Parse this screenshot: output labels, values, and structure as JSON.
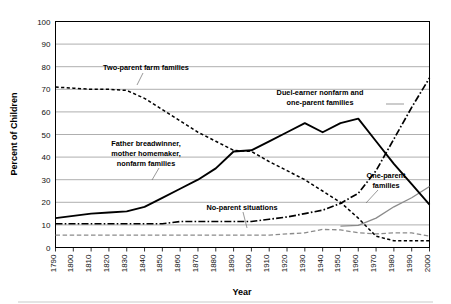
{
  "chart_data": {
    "type": "line",
    "title": "",
    "xlabel": "Year",
    "ylabel": "Percent of Children",
    "xlim": [
      1790,
      2000
    ],
    "ylim": [
      0,
      100
    ],
    "grid": true,
    "legend": "annotations-on-plot",
    "x": [
      1790,
      1800,
      1810,
      1820,
      1830,
      1840,
      1850,
      1860,
      1870,
      1880,
      1890,
      1900,
      1910,
      1920,
      1930,
      1940,
      1950,
      1960,
      1970,
      1980,
      1990,
      2000
    ],
    "y_ticks": [
      0,
      10,
      20,
      30,
      40,
      50,
      60,
      70,
      80,
      90,
      100
    ],
    "x_tick_labels": [
      "1790",
      "1800",
      "1810",
      "1820",
      "1830",
      "1840",
      "1850",
      "1860",
      "1870",
      "1880",
      "1890",
      "1900",
      "1910",
      "1920",
      "1930",
      "1940",
      "1950",
      "1960",
      "1970",
      "1980",
      "1990",
      "2000"
    ],
    "series": [
      {
        "name": "Two-parent farm families",
        "style": "dashed-black",
        "x": [
          1790,
          1800,
          1810,
          1820,
          1830,
          1840,
          1850,
          1860,
          1870,
          1880,
          1890,
          1900,
          1910,
          1920,
          1930,
          1940,
          1950,
          1960,
          1970,
          1980,
          1990,
          2000
        ],
        "values": [
          71,
          70.5,
          70,
          70,
          69.5,
          66,
          61,
          56,
          51,
          47,
          43,
          42.5,
          38,
          34,
          30,
          25,
          20,
          13,
          5,
          3,
          3,
          3
        ]
      },
      {
        "name": "Father breadwinner, mother homemaker, nonfarm families",
        "style": "solid-black",
        "x": [
          1790,
          1800,
          1810,
          1820,
          1830,
          1840,
          1850,
          1860,
          1870,
          1880,
          1890,
          1900,
          1910,
          1920,
          1930,
          1940,
          1950,
          1960,
          1970,
          1980,
          1990,
          2000
        ],
        "values": [
          13,
          14,
          15,
          15.5,
          16,
          18,
          22,
          26,
          30,
          35,
          42.5,
          43,
          47,
          51,
          55,
          51,
          55,
          57,
          47,
          37,
          28,
          19
        ]
      },
      {
        "name": "Duel-earner nonfarm and one-parent families",
        "style": "dash-dot-black",
        "x": [
          1790,
          1800,
          1810,
          1820,
          1830,
          1840,
          1850,
          1860,
          1870,
          1880,
          1890,
          1900,
          1910,
          1920,
          1930,
          1940,
          1950,
          1960,
          1970,
          1980,
          1990,
          2000
        ],
        "values": [
          10.5,
          10.5,
          10.5,
          10.5,
          10.5,
          10.5,
          10.5,
          11.5,
          11.5,
          11.5,
          11.5,
          11.5,
          12.5,
          13.5,
          15,
          16.5,
          19.5,
          24,
          34,
          48,
          62,
          75
        ]
      },
      {
        "name": "One-parent families",
        "style": "solid-gray",
        "x": [
          1950,
          1960,
          1970,
          1980,
          1990,
          2000
        ],
        "values": [
          9.5,
          9.8,
          13,
          18,
          22,
          27
        ]
      },
      {
        "name": "No-parent situations",
        "style": "dashed-gray",
        "x": [
          1790,
          1800,
          1810,
          1820,
          1830,
          1840,
          1850,
          1860,
          1870,
          1880,
          1890,
          1900,
          1910,
          1920,
          1930,
          1940,
          1950,
          1960,
          1970,
          1980,
          1990,
          2000
        ],
        "values": [
          5.5,
          5.5,
          5.5,
          5.5,
          5.5,
          5.5,
          5.5,
          5.5,
          5.5,
          5.5,
          5.5,
          5.5,
          5.5,
          6,
          6.5,
          8,
          7.8,
          6.5,
          6,
          6.5,
          6.5,
          5
        ]
      }
    ],
    "annotations": [
      {
        "text_lines": [
          "Two-parent farm families"
        ],
        "anchor": "1830"
      },
      {
        "text_lines": [
          "Father breadwinner,",
          "mother homemaker,",
          "nonfarm families"
        ],
        "anchor": "1860"
      },
      {
        "text_lines": [
          "Duel-earner nonfarm and",
          "one-parent families"
        ],
        "anchor": "1985"
      },
      {
        "text_lines": [
          "One-parent families"
        ],
        "anchor": "1975"
      },
      {
        "text_lines": [
          "No-parent situations"
        ],
        "anchor": "1905"
      }
    ]
  },
  "axes": {
    "y_label": "Percent of Children",
    "x_label": "Year",
    "y_tick_labels": [
      "100",
      "90",
      "80",
      "70",
      "60",
      "50",
      "40",
      "30",
      "20",
      "10",
      "0"
    ],
    "x_tick_labels": [
      "1790",
      "1800",
      "1810",
      "1820",
      "1830",
      "1840",
      "1850",
      "1860",
      "1870",
      "1880",
      "1890",
      "1900",
      "1910",
      "1920",
      "1930",
      "1940",
      "1950",
      "1960",
      "1970",
      "1980",
      "1990",
      "2000"
    ]
  },
  "annotations": {
    "farm": "Two-parent farm families",
    "breadwinner_l1": "Father breadwinner,",
    "breadwinner_l2": "mother homemaker,",
    "breadwinner_l3": "nonfarm families",
    "dual_l1": "Duel-earner nonfarm and",
    "dual_l2": "one-parent families",
    "oneparent_l1": "One-parent",
    "oneparent_l2": "families",
    "noparent": "No-parent situations"
  },
  "colors": {
    "ink": "#000000",
    "gray_series": "#8b8b8b",
    "gridline": "#9a9a9a",
    "background": "#ffffff"
  }
}
